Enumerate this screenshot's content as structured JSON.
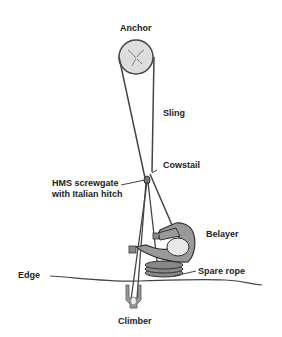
{
  "diagram": {
    "labels": {
      "anchor": "Anchor",
      "sling": "Sling",
      "cowstail": "Cowstail",
      "hms_line1": "HMS screwgate",
      "hms_line2": "with Italian hitch",
      "belayer": "Belayer",
      "spare_rope": "Spare rope",
      "edge": "Edge",
      "climber": "Climber"
    },
    "colors": {
      "line": "#444444",
      "fill_light": "#dddddd",
      "fill_body": "#999999",
      "background": "#ffffff"
    }
  }
}
